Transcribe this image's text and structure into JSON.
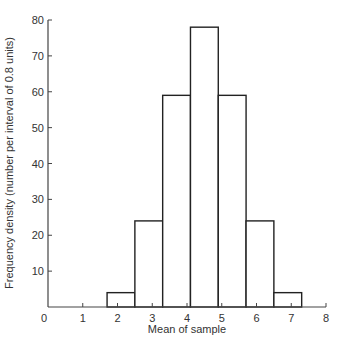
{
  "chart_data": {
    "type": "bar",
    "subtype": "histogram",
    "title": "",
    "xlabel": "Mean of sample",
    "ylabel": "Frequency density (number per interval of 0.8 units)",
    "xlim": [
      0,
      8
    ],
    "ylim": [
      0,
      80
    ],
    "x_ticks": [
      0,
      1,
      2,
      3,
      4,
      5,
      6,
      7,
      8
    ],
    "y_ticks": [
      10,
      20,
      30,
      40,
      50,
      60,
      70,
      80
    ],
    "grid": false,
    "legend": null,
    "bin_width": 0.8,
    "bins": [
      {
        "start": 1.7,
        "end": 2.5,
        "value": 4
      },
      {
        "start": 2.5,
        "end": 3.3,
        "value": 24
      },
      {
        "start": 3.3,
        "end": 4.1,
        "value": 59
      },
      {
        "start": 4.1,
        "end": 4.9,
        "value": 78
      },
      {
        "start": 4.9,
        "end": 5.7,
        "value": 59
      },
      {
        "start": 5.7,
        "end": 6.5,
        "value": 24
      },
      {
        "start": 6.5,
        "end": 7.3,
        "value": 4
      }
    ],
    "categories": [
      "1.7-2.5",
      "2.5-3.3",
      "3.3-4.1",
      "4.1-4.9",
      "4.9-5.7",
      "5.7-6.5",
      "6.5-7.3"
    ],
    "values": [
      4,
      24,
      59,
      78,
      59,
      24,
      4
    ]
  },
  "colors": {
    "bar_fill": "#ffffff",
    "bar_stroke": "#222222",
    "axis": "#444444",
    "text": "#333333"
  }
}
